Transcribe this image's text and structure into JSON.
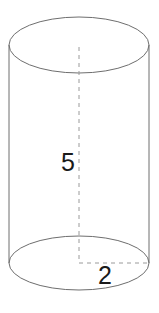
{
  "figure": {
    "type": "geometric-solid",
    "shape_name": "cylinder",
    "background_color": "#ffffff",
    "outline_color": "#6e6e6e",
    "dashed_color": "#9a9a9a",
    "label_color": "#1a1a1a",
    "labels": {
      "height": "5",
      "radius": "2"
    },
    "geometry": {
      "center_x": 79,
      "radius_x": 70,
      "radius_y": 28,
      "top_center_y": 45,
      "bottom_center_y": 263,
      "height_px": 218
    },
    "dimension_lines": {
      "height_axis": {
        "label": "5",
        "orientation": "vertical",
        "style": "dashed",
        "label_x": 68,
        "label_y": 164
      },
      "radius_line": {
        "label": "2",
        "orientation": "horizontal",
        "style": "dashed",
        "label_x": 105,
        "label_y": 277
      }
    }
  }
}
